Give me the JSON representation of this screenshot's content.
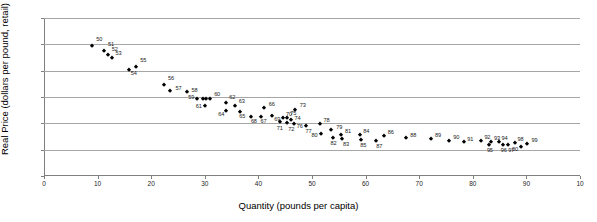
{
  "chart_data": {
    "type": "scatter",
    "title": "",
    "xlabel": "Quantity (pounds per capita)",
    "ylabel": "Real Price (dollars per pound, retail)",
    "xlim": [
      0,
      100
    ],
    "ylim": [
      0,
      3.0
    ],
    "xticks": [
      "0",
      "10",
      "20",
      "30",
      "40",
      "50",
      "60",
      "70",
      "80",
      "90",
      "10"
    ],
    "xtick_values": [
      0,
      10,
      20,
      30,
      40,
      50,
      60,
      70,
      80,
      90,
      100
    ],
    "yticks": [
      "0.00",
      "0.50",
      "1.00",
      "1.50",
      "2.00",
      "2.50",
      "3.00"
    ],
    "ytick_values": [
      0.0,
      0.5,
      1.0,
      1.5,
      2.0,
      2.5,
      3.0
    ],
    "grid": "horizontal",
    "legend": "none",
    "marker": "diamond",
    "marker_color": "#000000",
    "grid_color": "#a6a6a6",
    "points": [
      {
        "label": "50",
        "x": 9.0,
        "y": 2.47,
        "lx": 4,
        "ly": -7
      },
      {
        "label": "51",
        "x": 11.2,
        "y": 2.38,
        "lx": 4,
        "ly": -7
      },
      {
        "label": "52",
        "x": 11.9,
        "y": 2.3,
        "lx": 4,
        "ly": -6
      },
      {
        "label": "53",
        "x": 12.6,
        "y": 2.24,
        "lx": 4,
        "ly": -5
      },
      {
        "label": "54",
        "x": 15.8,
        "y": 2.01,
        "lx": 2,
        "ly": 3
      },
      {
        "label": "55",
        "x": 17.2,
        "y": 2.07,
        "lx": 4,
        "ly": -7
      },
      {
        "label": "56",
        "x": 22.4,
        "y": 1.73,
        "lx": 4,
        "ly": -7
      },
      {
        "label": "57",
        "x": 23.6,
        "y": 1.62,
        "lx": 5,
        "ly": -3
      },
      {
        "label": "58",
        "x": 26.6,
        "y": 1.6,
        "lx": 5,
        "ly": -2
      },
      {
        "label": "59",
        "x": 28.6,
        "y": 1.46,
        "lx": -9,
        "ly": -2
      },
      {
        "label": "60",
        "x": 31.0,
        "y": 1.46,
        "lx": 4,
        "ly": -5
      },
      {
        "label": "60b",
        "x": 30.2,
        "y": 1.46,
        "lx": 99,
        "ly": 99
      },
      {
        "label": "60c",
        "x": 29.6,
        "y": 1.46,
        "lx": 99,
        "ly": 99
      },
      {
        "label": "61",
        "x": 30.0,
        "y": 1.33,
        "lx": -9,
        "ly": 0
      },
      {
        "label": "62",
        "x": 34.0,
        "y": 1.38,
        "lx": 3,
        "ly": -6
      },
      {
        "label": "63",
        "x": 35.6,
        "y": 1.32,
        "lx": 4,
        "ly": -5
      },
      {
        "label": "64",
        "x": 34.0,
        "y": 1.23,
        "lx": -8,
        "ly": 3
      },
      {
        "label": "65",
        "x": 36.6,
        "y": 1.21,
        "lx": -1,
        "ly": 4
      },
      {
        "label": "66",
        "x": 41.0,
        "y": 1.29,
        "lx": 5,
        "ly": -4
      },
      {
        "label": "68",
        "x": 38.6,
        "y": 1.12,
        "lx": 0,
        "ly": 4
      },
      {
        "label": "67",
        "x": 40.4,
        "y": 1.12,
        "lx": 0,
        "ly": 4
      },
      {
        "label": "69",
        "x": 42.6,
        "y": 1.13,
        "lx": 2,
        "ly": 3
      },
      {
        "label": "70",
        "x": 44.6,
        "y": 1.1,
        "lx": 3,
        "ly": -4
      },
      {
        "label": "71",
        "x": 44.0,
        "y": 1.02,
        "lx": -3,
        "ly": 6
      },
      {
        "label": "72",
        "x": 45.4,
        "y": 1.0,
        "lx": 1,
        "ly": 6
      },
      {
        "label": "73",
        "x": 46.8,
        "y": 1.26,
        "lx": 5,
        "ly": -5
      },
      {
        "label": "74",
        "x": 46.0,
        "y": 1.06,
        "lx": 4,
        "ly": -2
      },
      {
        "label": "75",
        "x": 45.4,
        "y": 1.1,
        "lx": 3,
        "ly": -5
      },
      {
        "label": "76",
        "x": 46.6,
        "y": 0.99,
        "lx": 3,
        "ly": 2
      },
      {
        "label": "77",
        "x": 48.8,
        "y": 0.95,
        "lx": 0,
        "ly": 5
      },
      {
        "label": "78",
        "x": 51.4,
        "y": 0.99,
        "lx": 4,
        "ly": -4
      },
      {
        "label": "79",
        "x": 53.6,
        "y": 0.87,
        "lx": 5,
        "ly": -3
      },
      {
        "label": "80",
        "x": 51.6,
        "y": 0.79,
        "lx": -9,
        "ly": 1
      },
      {
        "label": "81",
        "x": 55.4,
        "y": 0.78,
        "lx": 4,
        "ly": -4
      },
      {
        "label": "82",
        "x": 54.0,
        "y": 0.72,
        "lx": -3,
        "ly": 5
      },
      {
        "label": "83",
        "x": 55.6,
        "y": 0.71,
        "lx": 1,
        "ly": 5
      },
      {
        "label": "84",
        "x": 59.0,
        "y": 0.78,
        "lx": 3,
        "ly": -4
      },
      {
        "label": "85",
        "x": 59.2,
        "y": 0.69,
        "lx": -1,
        "ly": 5
      },
      {
        "label": "86",
        "x": 63.4,
        "y": 0.76,
        "lx": 4,
        "ly": -4
      },
      {
        "label": "87",
        "x": 62.0,
        "y": 0.66,
        "lx": 0,
        "ly": 5
      },
      {
        "label": "88",
        "x": 67.6,
        "y": 0.72,
        "lx": 4,
        "ly": -3
      },
      {
        "label": "89",
        "x": 72.2,
        "y": 0.71,
        "lx": 4,
        "ly": -4
      },
      {
        "label": "90",
        "x": 75.6,
        "y": 0.67,
        "lx": 4,
        "ly": -4
      },
      {
        "label": "91",
        "x": 78.4,
        "y": 0.64,
        "lx": 3,
        "ly": -3
      },
      {
        "label": "92",
        "x": 81.6,
        "y": 0.66,
        "lx": 3,
        "ly": -4
      },
      {
        "label": "93",
        "x": 83.4,
        "y": 0.64,
        "lx": 3,
        "ly": -4
      },
      {
        "label": "94",
        "x": 84.8,
        "y": 0.64,
        "lx": 3,
        "ly": -4
      },
      {
        "label": "95",
        "x": 83.0,
        "y": 0.58,
        "lx": -2,
        "ly": 5
      },
      {
        "label": "96",
        "x": 85.6,
        "y": 0.59,
        "lx": -2,
        "ly": 5
      },
      {
        "label": "97",
        "x": 86.6,
        "y": 0.58,
        "lx": 0,
        "ly": 5
      },
      {
        "label": "98",
        "x": 87.8,
        "y": 0.63,
        "lx": 3,
        "ly": -4
      },
      {
        "label": "00",
        "x": 89.0,
        "y": 0.56,
        "lx": -9,
        "ly": 2
      },
      {
        "label": "99",
        "x": 90.2,
        "y": 0.61,
        "lx": 4,
        "ly": -4
      }
    ]
  }
}
